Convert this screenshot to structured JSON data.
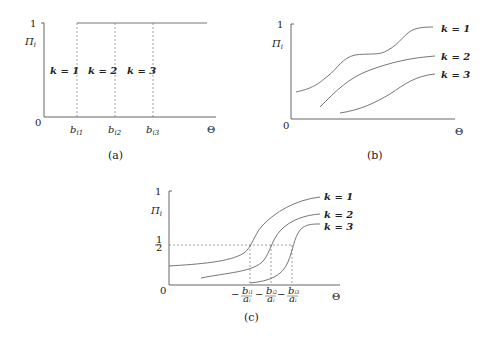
{
  "figure": {
    "panels": [
      {
        "id": "a",
        "caption": "(a)",
        "y_axis_label": "Πi",
        "y_top_tick": "1",
        "origin_label": "0",
        "x_axis_label": "Θ",
        "x_ticks": [
          "bi1",
          "bi2",
          "bi3"
        ],
        "region_labels": [
          "k = 1",
          "k = 2",
          "k = 3"
        ]
      },
      {
        "id": "b",
        "caption": "(b)",
        "y_axis_label": "Πi",
        "y_top_tick": "1",
        "origin_label": "0",
        "x_axis_label": "Θ",
        "curve_labels": [
          "k = 1",
          "k = 2",
          "k = 3"
        ]
      },
      {
        "id": "c",
        "caption": "(c)",
        "y_axis_label": "Πi",
        "y_top_tick": "1",
        "y_half_tick": "1/2",
        "origin_label": "0",
        "x_axis_label": "Θ",
        "x_ticks": [
          "−bi1/ai",
          "−bi2/ai",
          "−bi3/ai"
        ],
        "curve_labels": [
          "k = 1",
          "k = 2",
          "k = 3"
        ]
      }
    ]
  }
}
